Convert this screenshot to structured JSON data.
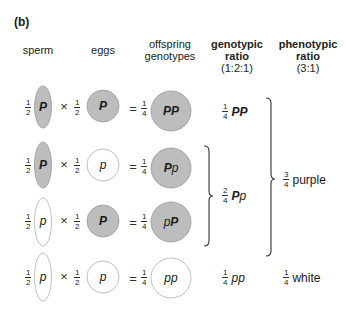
{
  "panel_label": "(b)",
  "headers": {
    "sperm": "sperm",
    "eggs": "eggs",
    "offspring_line1": "offspring",
    "offspring_line2": "genotypes",
    "genotypic_line1": "genotypic",
    "genotypic_line2": "ratio",
    "genotypic_line3": "(1:2:1)",
    "phenotypic_line1": "phenotypic",
    "phenotypic_line2": "ratio",
    "phenotypic_line3": "(3:1)"
  },
  "colors": {
    "purple_fill": "#bdbdbd",
    "purple_stroke": "#999999",
    "white_fill": "#ffffff",
    "white_stroke": "#b0b0b0",
    "brace": "#333333"
  },
  "operators": {
    "times": "×",
    "equals": "="
  },
  "rows": [
    {
      "sperm": {
        "num": "1",
        "den": "2",
        "allele_a": "P",
        "allele_a_dom": true,
        "filled": true
      },
      "egg": {
        "num": "1",
        "den": "2",
        "allele_a": "P",
        "allele_a_dom": true,
        "filled": true
      },
      "offspring": {
        "num": "1",
        "den": "4",
        "allele_a": "P",
        "allele_b": "P",
        "filled": true
      },
      "genotypic": {
        "num": "1",
        "den": "4",
        "allele_a": "P",
        "allele_b": "P"
      }
    },
    {
      "sperm": {
        "num": "1",
        "den": "2",
        "allele_a": "P",
        "allele_a_dom": true,
        "filled": true
      },
      "egg": {
        "num": "1",
        "den": "2",
        "allele_a": "p",
        "allele_a_dom": false,
        "filled": false
      },
      "offspring": {
        "num": "1",
        "den": "4",
        "allele_a": "P",
        "allele_b": "p",
        "filled": true
      }
    },
    {
      "sperm": {
        "num": "1",
        "den": "2",
        "allele_a": "p",
        "allele_a_dom": false,
        "filled": false
      },
      "egg": {
        "num": "1",
        "den": "2",
        "allele_a": "P",
        "allele_a_dom": true,
        "filled": true
      },
      "offspring": {
        "num": "1",
        "den": "4",
        "allele_a": "p",
        "allele_b": "P",
        "filled": true
      }
    },
    {
      "sperm": {
        "num": "1",
        "den": "2",
        "allele_a": "p",
        "allele_a_dom": false,
        "filled": false
      },
      "egg": {
        "num": "1",
        "den": "2",
        "allele_a": "p",
        "allele_a_dom": false,
        "filled": false
      },
      "offspring": {
        "num": "1",
        "den": "4",
        "allele_a": "p",
        "allele_b": "p",
        "filled": false
      },
      "genotypic": {
        "num": "1",
        "den": "4",
        "allele_a": "p",
        "allele_b": "p"
      }
    }
  ],
  "genotypic_het": {
    "num": "2",
    "den": "4",
    "allele_a": "P",
    "allele_b": "p"
  },
  "phenotypic": [
    {
      "num": "3",
      "den": "4",
      "label": "purple"
    },
    {
      "num": "1",
      "den": "4",
      "label": "white"
    }
  ]
}
